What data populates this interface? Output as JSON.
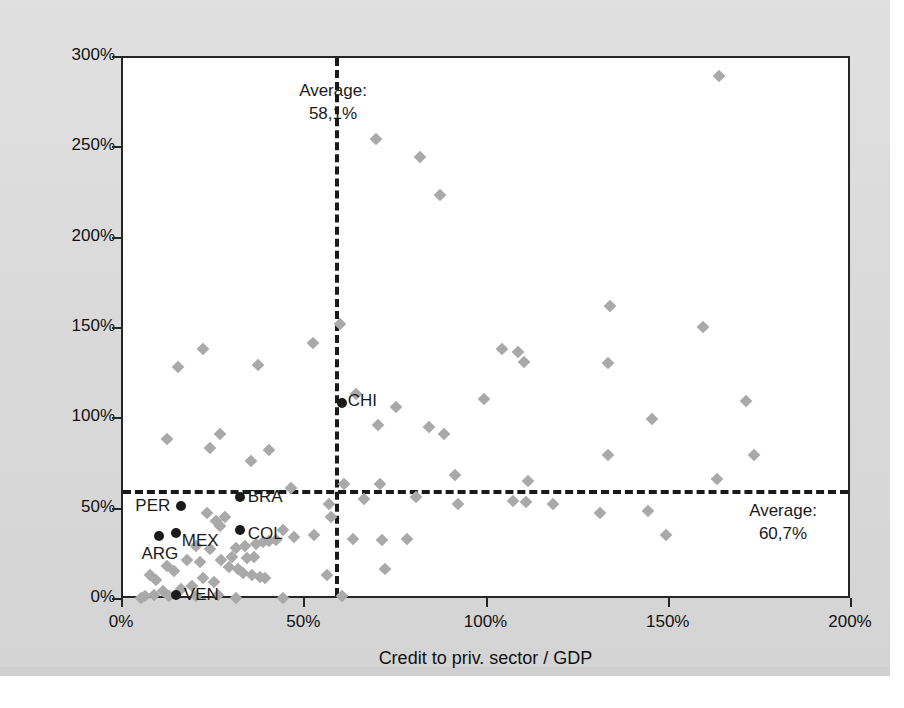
{
  "chart_data": {
    "type": "scatter",
    "title": "",
    "xlabel": "Credit to priv. sector / GDP",
    "ylabel": "Stock mk cap / GDP",
    "xlim": [
      0,
      200
    ],
    "ylim": [
      0,
      300
    ],
    "xticks": [
      "0%",
      "50%",
      "100%",
      "150%",
      "200%"
    ],
    "xtick_values": [
      0,
      50,
      100,
      150,
      200
    ],
    "yticks": [
      "0%",
      "50%",
      "100%",
      "150%",
      "200%",
      "250%",
      "300%"
    ],
    "ytick_values": [
      0,
      50,
      100,
      150,
      200,
      250,
      300
    ],
    "grid": false,
    "legend": null,
    "annotations": [
      {
        "name": "average-x",
        "line1": "Average:",
        "line2": "58,1%",
        "value": 58.1,
        "axis": "x",
        "style": "dashed-vertical"
      },
      {
        "name": "average-y",
        "line1": "Average:",
        "line2": "60,7%",
        "value": 60.7,
        "axis": "y",
        "style": "dashed-horizontal"
      }
    ],
    "series": [
      {
        "name": "highlighted-countries",
        "marker": "circle",
        "color": "#1a1a1a",
        "points": [
          {
            "label": "CHI",
            "x": 60.0,
            "y": 109.0,
            "label_dx": 6,
            "label_dy": -2
          },
          {
            "label": "BRA",
            "x": 32.0,
            "y": 57.0,
            "label_dx": 8,
            "label_dy": 0
          },
          {
            "label": "PER",
            "x": 16.0,
            "y": 52.0,
            "label_dx": -46,
            "label_dy": 0
          },
          {
            "label": "COL",
            "x": 32.0,
            "y": 39.0,
            "label_dx": 8,
            "label_dy": 4
          },
          {
            "label": "MEX",
            "x": 14.5,
            "y": 37.0,
            "label_dx": 6,
            "label_dy": 8
          },
          {
            "label": "ARG",
            "x": 10.0,
            "y": 35.5,
            "label_dx": -18,
            "label_dy": 18
          },
          {
            "label": "VEN",
            "x": 14.5,
            "y": 3.0,
            "label_dx": 8,
            "label_dy": 0
          }
        ]
      },
      {
        "name": "other-countries",
        "marker": "diamond",
        "color": "#a9a9a9",
        "points": [
          {
            "x": 163.5,
            "y": 290.0
          },
          {
            "x": 69.5,
            "y": 255.0
          },
          {
            "x": 81.5,
            "y": 245.0
          },
          {
            "x": 87.0,
            "y": 224.0
          },
          {
            "x": 133.5,
            "y": 163.0
          },
          {
            "x": 159.0,
            "y": 151.0
          },
          {
            "x": 59.5,
            "y": 153.0
          },
          {
            "x": 22.0,
            "y": 139.0
          },
          {
            "x": 52.0,
            "y": 142.0
          },
          {
            "x": 104.0,
            "y": 139.0
          },
          {
            "x": 108.5,
            "y": 137.0
          },
          {
            "x": 110.0,
            "y": 132.0
          },
          {
            "x": 133.0,
            "y": 131.0
          },
          {
            "x": 15.0,
            "y": 129.0
          },
          {
            "x": 37.0,
            "y": 130.0
          },
          {
            "x": 64.0,
            "y": 114.0
          },
          {
            "x": 99.0,
            "y": 111.0
          },
          {
            "x": 171.0,
            "y": 110.0
          },
          {
            "x": 75.0,
            "y": 107.0
          },
          {
            "x": 145.0,
            "y": 100.0
          },
          {
            "x": 70.0,
            "y": 97.0
          },
          {
            "x": 84.0,
            "y": 96.0
          },
          {
            "x": 12.0,
            "y": 89.0
          },
          {
            "x": 26.5,
            "y": 92.0
          },
          {
            "x": 88.0,
            "y": 92.0
          },
          {
            "x": 24.0,
            "y": 84.0
          },
          {
            "x": 40.0,
            "y": 83.0
          },
          {
            "x": 35.0,
            "y": 77.0
          },
          {
            "x": 133.0,
            "y": 80.0
          },
          {
            "x": 173.0,
            "y": 80.0
          },
          {
            "x": 111.0,
            "y": 66.0
          },
          {
            "x": 46.0,
            "y": 62.0
          },
          {
            "x": 91.0,
            "y": 69.0
          },
          {
            "x": 163.0,
            "y": 67.0
          },
          {
            "x": 60.5,
            "y": 64.0
          },
          {
            "x": 70.5,
            "y": 64.0
          },
          {
            "x": 66.0,
            "y": 56.0
          },
          {
            "x": 80.5,
            "y": 57.0
          },
          {
            "x": 107.0,
            "y": 55.0
          },
          {
            "x": 110.5,
            "y": 54.0
          },
          {
            "x": 118.0,
            "y": 53.0
          },
          {
            "x": 92.0,
            "y": 53.0
          },
          {
            "x": 131.0,
            "y": 48.0
          },
          {
            "x": 144.0,
            "y": 49.0
          },
          {
            "x": 23.0,
            "y": 48.0
          },
          {
            "x": 28.0,
            "y": 46.0
          },
          {
            "x": 25.5,
            "y": 44.0
          },
          {
            "x": 26.5,
            "y": 41.0
          },
          {
            "x": 44.0,
            "y": 39.0
          },
          {
            "x": 47.0,
            "y": 35.0
          },
          {
            "x": 78.0,
            "y": 34.0
          },
          {
            "x": 63.0,
            "y": 34.0
          },
          {
            "x": 71.0,
            "y": 33.0
          },
          {
            "x": 20.0,
            "y": 30.0
          },
          {
            "x": 24.0,
            "y": 28.0
          },
          {
            "x": 31.0,
            "y": 29.0
          },
          {
            "x": 33.5,
            "y": 30.0
          },
          {
            "x": 36.5,
            "y": 31.0
          },
          {
            "x": 38.5,
            "y": 32.0
          },
          {
            "x": 40.0,
            "y": 32.5
          },
          {
            "x": 42.0,
            "y": 33.0
          },
          {
            "x": 30.0,
            "y": 24.0
          },
          {
            "x": 34.0,
            "y": 23.0
          },
          {
            "x": 36.0,
            "y": 24.0
          },
          {
            "x": 27.0,
            "y": 22.0
          },
          {
            "x": 17.5,
            "y": 22.0
          },
          {
            "x": 21.0,
            "y": 21.0
          },
          {
            "x": 12.0,
            "y": 19.0
          },
          {
            "x": 14.0,
            "y": 16.0
          },
          {
            "x": 7.5,
            "y": 14.0
          },
          {
            "x": 9.0,
            "y": 11.0
          },
          {
            "x": 29.0,
            "y": 18.0
          },
          {
            "x": 31.5,
            "y": 17.0
          },
          {
            "x": 33.0,
            "y": 15.0
          },
          {
            "x": 35.5,
            "y": 14.0
          },
          {
            "x": 37.5,
            "y": 13.0
          },
          {
            "x": 39.0,
            "y": 12.0
          },
          {
            "x": 22.0,
            "y": 12.0
          },
          {
            "x": 25.0,
            "y": 10.0
          },
          {
            "x": 19.0,
            "y": 8.0
          },
          {
            "x": 16.0,
            "y": 6.0
          },
          {
            "x": 11.0,
            "y": 5.0
          },
          {
            "x": 8.5,
            "y": 3.0
          },
          {
            "x": 6.0,
            "y": 2.0
          },
          {
            "x": 5.0,
            "y": 1.0
          },
          {
            "x": 12.5,
            "y": 2.0
          },
          {
            "x": 20.0,
            "y": 2.0
          },
          {
            "x": 26.0,
            "y": 3.0
          },
          {
            "x": 31.0,
            "y": 1.0
          },
          {
            "x": 44.0,
            "y": 1.0
          },
          {
            "x": 56.0,
            "y": 14.0
          },
          {
            "x": 60.0,
            "y": 2.0
          },
          {
            "x": 72.0,
            "y": 17.0
          },
          {
            "x": 56.5,
            "y": 53.0
          },
          {
            "x": 57.0,
            "y": 46.0
          },
          {
            "x": 52.5,
            "y": 36.0
          },
          {
            "x": 149.0,
            "y": 36.0
          }
        ]
      }
    ]
  }
}
